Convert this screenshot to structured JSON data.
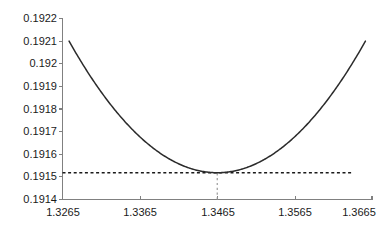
{
  "chart_data": {
    "type": "line",
    "title": "",
    "subtitle": "",
    "xlabel": "",
    "ylabel": "",
    "xlim": [
      1.3265,
      1.3665
    ],
    "ylim": [
      0.1914,
      0.1922
    ],
    "grid": false,
    "legend": null,
    "x_ticks": [
      "1.3265",
      "1.3365",
      "1.3465",
      "1.3565",
      "1.3665"
    ],
    "x_tick_values": [
      1.3265,
      1.3365,
      1.3465,
      1.3565,
      1.3665
    ],
    "y_ticks": [
      "0.1914",
      "0.1915",
      "0.1916",
      "0.1917",
      "0.1918",
      "0.1919",
      "0.192",
      "0.1921",
      "0.1922"
    ],
    "y_tick_values": [
      0.1914,
      0.1915,
      0.1916,
      0.1917,
      0.1918,
      0.1919,
      0.192,
      0.1921,
      0.1922
    ],
    "series": [
      {
        "name": "objective-curve",
        "shape": "parabola",
        "color": "#2b2b2b",
        "vertex": [
          1.3465,
          0.191518
        ],
        "x": [
          1.3274,
          1.3294,
          1.3314,
          1.3334,
          1.3354,
          1.3374,
          1.3394,
          1.3414,
          1.3434,
          1.3445,
          1.3455,
          1.3465,
          1.3475,
          1.3485,
          1.3496,
          1.3516,
          1.3536,
          1.3556,
          1.3576,
          1.3596,
          1.3616,
          1.3636,
          1.3656
        ],
        "y": [
          0.192095,
          0.191975,
          0.191865,
          0.191766,
          0.191678,
          0.1916,
          0.191733,
          0.191575,
          0.19153,
          0.191522,
          0.191519,
          0.191518,
          0.191519,
          0.191522,
          0.19153,
          0.19156,
          0.191601,
          0.191652,
          0.191714,
          0.191787,
          0.19187,
          0.191964,
          0.192069
        ]
      }
    ],
    "annotations": [
      {
        "name": "minimum-horizontal-reference",
        "type": "hline",
        "y": 0.191518,
        "x_start": 1.3265,
        "x_end": 1.364,
        "style": "dashed",
        "color": "#1a1a1a"
      },
      {
        "name": "minimum-vertical-reference",
        "type": "vline",
        "x": 1.3465,
        "y_start": 0.1914,
        "y_end": 0.191518,
        "style": "dashed",
        "color": "#9a9a9a"
      }
    ]
  }
}
